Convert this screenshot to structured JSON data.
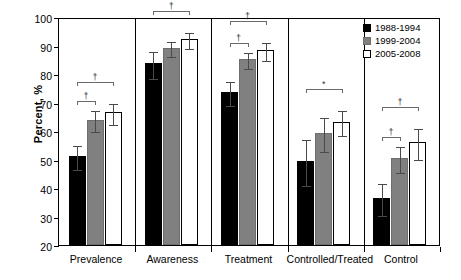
{
  "chart_data": {
    "type": "bar",
    "title": "",
    "xlabel": "",
    "ylabel": "Percent, %",
    "ylim": [
      20,
      100
    ],
    "ytick_step": 10,
    "yticks": [
      100,
      90,
      80,
      70,
      60,
      50,
      40,
      30,
      20
    ],
    "grid": false,
    "legend_position": "top-right",
    "categories": [
      "Prevalence",
      "Awareness",
      "Treatment",
      "Controlled/Treated",
      "Control"
    ],
    "series": [
      {
        "name": "1988-1994",
        "color": "#000000",
        "values": [
          51.3,
          83.7,
          73.6,
          49.5,
          36.5
        ],
        "err_low": [
          4.2,
          4.6,
          4.3,
          8.2,
          5.5
        ],
        "err_high": [
          4.2,
          4.6,
          4.3,
          8.2,
          5.5
        ]
      },
      {
        "name": "1999-2004",
        "color": "#808080",
        "values": [
          64.0,
          89.3,
          85.3,
          59.3,
          50.5
        ],
        "err_low": [
          3.8,
          2.6,
          2.8,
          6.0,
          4.5
        ],
        "err_high": [
          3.8,
          2.6,
          2.8,
          6.0,
          4.5
        ]
      },
      {
        "name": "2005-2008",
        "color": "#ffffff",
        "values": [
          66.5,
          92.3,
          88.5,
          63.3,
          56.0
        ],
        "err_low": [
          3.7,
          2.8,
          3.2,
          4.3,
          5.5
        ],
        "err_high": [
          3.7,
          2.8,
          3.2,
          4.3,
          5.5
        ]
      }
    ],
    "annotations": [
      {
        "group": "Prevalence",
        "symbol": "†",
        "from": 0,
        "to": 1,
        "level": 0
      },
      {
        "group": "Prevalence",
        "symbol": "†",
        "from": 0,
        "to": 2,
        "level": 1
      },
      {
        "group": "Awareness",
        "symbol": "†",
        "from": 0,
        "to": 2,
        "level": 1
      },
      {
        "group": "Treatment",
        "symbol": "†",
        "from": 0,
        "to": 1,
        "level": 0
      },
      {
        "group": "Treatment",
        "symbol": "†",
        "from": 0,
        "to": 2,
        "level": 1
      },
      {
        "group": "Controlled/Treated",
        "symbol": "*",
        "from": 0,
        "to": 2,
        "level": 1
      },
      {
        "group": "Control",
        "symbol": "†",
        "from": 0,
        "to": 1,
        "level": 0
      },
      {
        "group": "Control",
        "symbol": "†",
        "from": 0,
        "to": 2,
        "level": 1
      }
    ]
  },
  "legend": {
    "items": [
      {
        "label": "1988-1994"
      },
      {
        "label": "1999-2004"
      },
      {
        "label": "2005-2008"
      }
    ]
  },
  "axis": {
    "y_title": "Percent, %"
  }
}
